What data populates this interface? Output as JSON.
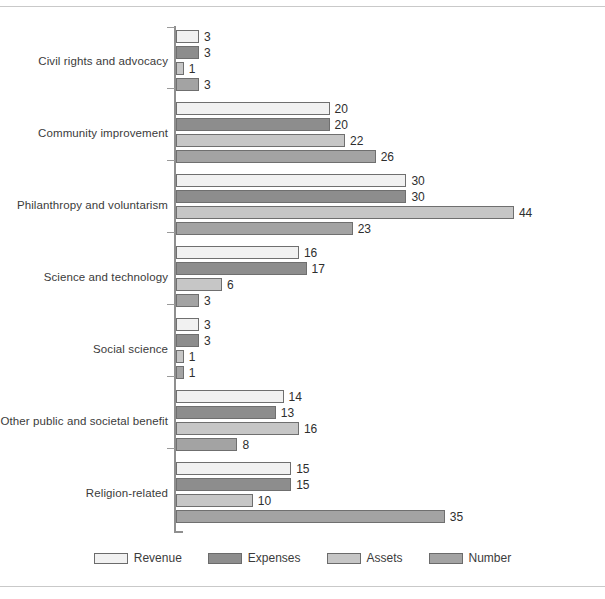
{
  "chart_data": {
    "type": "bar",
    "orientation": "horizontal",
    "title": "",
    "xlabel": "",
    "ylabel": "",
    "grid": false,
    "xlim": [
      0,
      44
    ],
    "legend_position": "bottom",
    "categories": [
      "Civil rights and advocacy",
      "Community improvement",
      "Philanthropy and voluntarism",
      "Science and technology",
      "Social science",
      "Other public and societal benefit",
      "Religion-related"
    ],
    "series": [
      {
        "name": "Revenue",
        "color": "#f1f1f1",
        "values": [
          3,
          20,
          30,
          16,
          3,
          14,
          15
        ]
      },
      {
        "name": "Expenses",
        "color": "#8d8d8d",
        "values": [
          3,
          20,
          30,
          17,
          3,
          13,
          15
        ]
      },
      {
        "name": "Assets",
        "color": "#c6c6c6",
        "values": [
          1,
          22,
          44,
          6,
          1,
          16,
          10
        ]
      },
      {
        "name": "Number",
        "color": "#a3a3a3",
        "values": [
          3,
          26,
          23,
          3,
          1,
          8,
          35
        ]
      }
    ]
  },
  "legend": {
    "items": [
      {
        "label": "Revenue"
      },
      {
        "label": "Expenses"
      },
      {
        "label": "Assets"
      },
      {
        "label": "Number"
      }
    ]
  }
}
